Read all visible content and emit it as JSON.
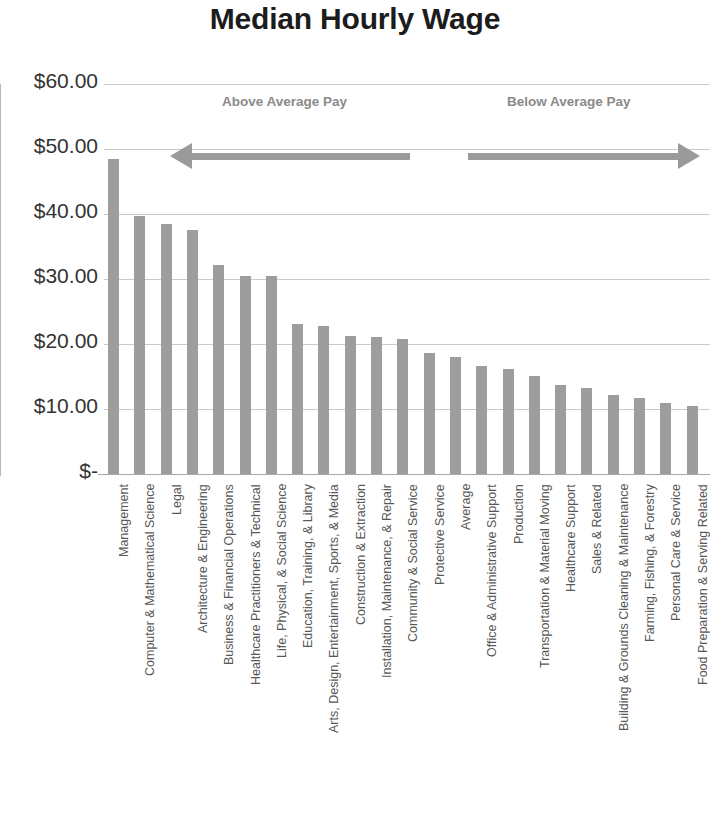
{
  "chart_data": {
    "type": "bar",
    "title": "Median Hourly Wage",
    "xlabel": "",
    "ylabel": "",
    "ylim": [
      0,
      60
    ],
    "grid": true,
    "legend": "none",
    "y_ticks": [
      "$60.00",
      "$50.00",
      "$40.00",
      "$30.00",
      "$20.00",
      "$10.00",
      "$-"
    ],
    "y_tick_values": [
      60,
      50,
      40,
      30,
      20,
      10,
      0
    ],
    "bar_color": "#9d9d9d",
    "categories": [
      "Management",
      "Computer & Mathematical Science",
      "Legal",
      "Architecture & Engineering",
      "Business & Financial Operations",
      "Healthcare Practitioners & Technical",
      "Life, Physical, & Social Science",
      "Education, Training, & Library",
      "Arts, Design, Entertainment, Sports, & Media",
      "Construction & Extraction",
      "Installation, Maintenance, & Repair",
      "Community & Social Service",
      "Protective Service",
      "Average",
      "Office & Administrative Support",
      "Production",
      "Transportation & Material Moving",
      "Healthcare Support",
      "Sales & Related",
      "Building & Grounds Cleaning & Maintenance",
      "Farming, Fishing, & Forestry",
      "Personal Care & Service",
      "Food Preparation & Serving Related"
    ],
    "values": [
      48.5,
      39.7,
      38.4,
      37.6,
      32.1,
      30.4,
      30.4,
      23.1,
      22.7,
      21.2,
      21.1,
      20.8,
      18.6,
      18.0,
      16.6,
      16.2,
      15.1,
      13.7,
      13.2,
      12.2,
      11.7,
      11.0,
      10.5
    ],
    "annotations": [
      {
        "label": "Above Average Pay",
        "direction": "left"
      },
      {
        "label": "Below Average Pay",
        "direction": "right"
      }
    ]
  }
}
